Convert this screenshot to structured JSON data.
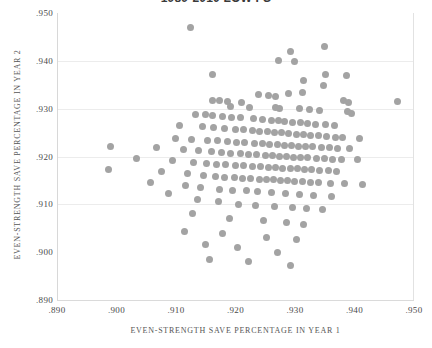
{
  "chart_data": {
    "type": "scatter",
    "title": "1989-2010 LOW FS",
    "xlabel": "EVEN-STRENGTH SAVE PERCENTAGE IN YEAR 1",
    "ylabel": "EVEN-STRENGTH SAVE PERCENTAGE IN YEAR 2",
    "xlim": [
      0.89,
      0.95
    ],
    "ylim": [
      0.89,
      0.95
    ],
    "xticks": [
      0.89,
      0.9,
      0.91,
      0.92,
      0.93,
      0.94,
      0.95
    ],
    "yticks": [
      0.89,
      0.9,
      0.91,
      0.92,
      0.93,
      0.94,
      0.95
    ],
    "xticklabels": [
      ".890",
      ".900",
      ".910",
      ".920",
      ".930",
      ".940",
      ".950"
    ],
    "yticklabels": [
      ".890",
      ".900",
      ".910",
      ".920",
      ".930",
      ".940",
      ".950"
    ],
    "grid": true,
    "gridlines_y": [
      0.91,
      0.92,
      0.93,
      0.94
    ],
    "legend": null,
    "marker_color": "#a3a3a3",
    "marker_size": 7,
    "points": [
      [
        0.9122,
        0.947
      ],
      [
        0.9291,
        0.9419
      ],
      [
        0.9347,
        0.943
      ],
      [
        0.927,
        0.94
      ],
      [
        0.9298,
        0.9399
      ],
      [
        0.935,
        0.9372
      ],
      [
        0.9384,
        0.937
      ],
      [
        0.916,
        0.9371
      ],
      [
        0.9313,
        0.936
      ],
      [
        0.9346,
        0.9348
      ],
      [
        0.931,
        0.9334
      ],
      [
        0.9287,
        0.9332
      ],
      [
        0.9237,
        0.933
      ],
      [
        0.9253,
        0.9328
      ],
      [
        0.9265,
        0.9325
      ],
      [
        0.916,
        0.9318
      ],
      [
        0.9171,
        0.9318
      ],
      [
        0.9184,
        0.9316
      ],
      [
        0.9208,
        0.9314
      ],
      [
        0.938,
        0.9318
      ],
      [
        0.9388,
        0.9312
      ],
      [
        0.919,
        0.9305
      ],
      [
        0.9222,
        0.9303
      ],
      [
        0.9266,
        0.9302
      ],
      [
        0.9273,
        0.93
      ],
      [
        0.9305,
        0.93
      ],
      [
        0.9322,
        0.9298
      ],
      [
        0.934,
        0.9296
      ],
      [
        0.9386,
        0.9294
      ],
      [
        0.9393,
        0.929
      ],
      [
        0.947,
        0.9315
      ],
      [
        0.9131,
        0.9288
      ],
      [
        0.9148,
        0.9288
      ],
      [
        0.916,
        0.9285
      ],
      [
        0.9176,
        0.9284
      ],
      [
        0.9192,
        0.9282
      ],
      [
        0.9206,
        0.9281
      ],
      [
        0.9228,
        0.928
      ],
      [
        0.9243,
        0.9278
      ],
      [
        0.9259,
        0.9276
      ],
      [
        0.927,
        0.9275
      ],
      [
        0.9281,
        0.9274
      ],
      [
        0.9294,
        0.9272
      ],
      [
        0.9308,
        0.9272
      ],
      [
        0.9319,
        0.927
      ],
      [
        0.9333,
        0.9268
      ],
      [
        0.935,
        0.9266
      ],
      [
        0.9364,
        0.9265
      ],
      [
        0.9104,
        0.9265
      ],
      [
        0.9143,
        0.9262
      ],
      [
        0.9162,
        0.926
      ],
      [
        0.9179,
        0.9258
      ],
      [
        0.9198,
        0.9257
      ],
      [
        0.9212,
        0.9256
      ],
      [
        0.9226,
        0.9254
      ],
      [
        0.9239,
        0.9253
      ],
      [
        0.9252,
        0.9252
      ],
      [
        0.9264,
        0.925
      ],
      [
        0.9276,
        0.925
      ],
      [
        0.9288,
        0.9248
      ],
      [
        0.93,
        0.9247
      ],
      [
        0.9313,
        0.9246
      ],
      [
        0.9325,
        0.9244
      ],
      [
        0.9338,
        0.9243
      ],
      [
        0.9352,
        0.9242
      ],
      [
        0.9366,
        0.924
      ],
      [
        0.9378,
        0.9239
      ],
      [
        0.9406,
        0.9238
      ],
      [
        0.9098,
        0.9238
      ],
      [
        0.9124,
        0.9236
      ],
      [
        0.9152,
        0.9234
      ],
      [
        0.9168,
        0.9233
      ],
      [
        0.9185,
        0.9232
      ],
      [
        0.92,
        0.923
      ],
      [
        0.9214,
        0.9229
      ],
      [
        0.923,
        0.9228
      ],
      [
        0.9244,
        0.9227
      ],
      [
        0.9256,
        0.9226
      ],
      [
        0.9268,
        0.9225
      ],
      [
        0.928,
        0.9224
      ],
      [
        0.9292,
        0.9223
      ],
      [
        0.9304,
        0.9222
      ],
      [
        0.9316,
        0.9221
      ],
      [
        0.9328,
        0.922
      ],
      [
        0.9342,
        0.9219
      ],
      [
        0.9356,
        0.9218
      ],
      [
        0.937,
        0.9217
      ],
      [
        0.939,
        0.9216
      ],
      [
        0.8988,
        0.9222
      ],
      [
        0.9066,
        0.9218
      ],
      [
        0.911,
        0.9214
      ],
      [
        0.9136,
        0.9212
      ],
      [
        0.9158,
        0.921
      ],
      [
        0.9174,
        0.9208
      ],
      [
        0.919,
        0.9207
      ],
      [
        0.9206,
        0.9206
      ],
      [
        0.922,
        0.9205
      ],
      [
        0.9234,
        0.9204
      ],
      [
        0.9248,
        0.9203
      ],
      [
        0.926,
        0.9202
      ],
      [
        0.9272,
        0.9201
      ],
      [
        0.9284,
        0.92
      ],
      [
        0.9296,
        0.9199
      ],
      [
        0.9308,
        0.9198
      ],
      [
        0.932,
        0.9197
      ],
      [
        0.9334,
        0.9196
      ],
      [
        0.9348,
        0.9195
      ],
      [
        0.9362,
        0.9194
      ],
      [
        0.9376,
        0.9193
      ],
      [
        0.9404,
        0.9193
      ],
      [
        0.9032,
        0.9196
      ],
      [
        0.9092,
        0.9192
      ],
      [
        0.9128,
        0.9188
      ],
      [
        0.915,
        0.9186
      ],
      [
        0.9166,
        0.9184
      ],
      [
        0.9182,
        0.9183
      ],
      [
        0.9198,
        0.9182
      ],
      [
        0.9212,
        0.9181
      ],
      [
        0.9226,
        0.918
      ],
      [
        0.924,
        0.9179
      ],
      [
        0.9254,
        0.9178
      ],
      [
        0.9266,
        0.9177
      ],
      [
        0.9278,
        0.9176
      ],
      [
        0.929,
        0.9175
      ],
      [
        0.9302,
        0.9174
      ],
      [
        0.9314,
        0.9173
      ],
      [
        0.9326,
        0.9172
      ],
      [
        0.934,
        0.9171
      ],
      [
        0.9354,
        0.917
      ],
      [
        0.9368,
        0.9169
      ],
      [
        0.8984,
        0.9172
      ],
      [
        0.9074,
        0.9168
      ],
      [
        0.9118,
        0.9164
      ],
      [
        0.9144,
        0.916
      ],
      [
        0.9164,
        0.9158
      ],
      [
        0.918,
        0.9157
      ],
      [
        0.9196,
        0.9156
      ],
      [
        0.921,
        0.9155
      ],
      [
        0.9224,
        0.9154
      ],
      [
        0.9238,
        0.9153
      ],
      [
        0.925,
        0.9152
      ],
      [
        0.9262,
        0.9151
      ],
      [
        0.9274,
        0.915
      ],
      [
        0.9286,
        0.9149
      ],
      [
        0.9298,
        0.9148
      ],
      [
        0.931,
        0.9147
      ],
      [
        0.9324,
        0.9146
      ],
      [
        0.9338,
        0.9145
      ],
      [
        0.9358,
        0.9144
      ],
      [
        0.9382,
        0.9143
      ],
      [
        0.9412,
        0.9142
      ],
      [
        0.9056,
        0.9146
      ],
      [
        0.9114,
        0.914
      ],
      [
        0.914,
        0.9136
      ],
      [
        0.9172,
        0.9132
      ],
      [
        0.9194,
        0.913
      ],
      [
        0.9216,
        0.9128
      ],
      [
        0.9236,
        0.9126
      ],
      [
        0.9258,
        0.9124
      ],
      [
        0.9282,
        0.9122
      ],
      [
        0.9306,
        0.912
      ],
      [
        0.933,
        0.9118
      ],
      [
        0.936,
        0.9116
      ],
      [
        0.9086,
        0.9122
      ],
      [
        0.9134,
        0.911
      ],
      [
        0.917,
        0.9105
      ],
      [
        0.9204,
        0.91
      ],
      [
        0.9232,
        0.9098
      ],
      [
        0.9264,
        0.9096
      ],
      [
        0.9294,
        0.9094
      ],
      [
        0.9318,
        0.9092
      ],
      [
        0.9344,
        0.909
      ],
      [
        0.9126,
        0.908
      ],
      [
        0.9188,
        0.907
      ],
      [
        0.9246,
        0.9066
      ],
      [
        0.9284,
        0.9062
      ],
      [
        0.9312,
        0.9058
      ],
      [
        0.9112,
        0.9044
      ],
      [
        0.9176,
        0.904
      ],
      [
        0.925,
        0.903
      ],
      [
        0.93,
        0.9026
      ],
      [
        0.9148,
        0.9016
      ],
      [
        0.9202,
        0.901
      ],
      [
        0.9268,
        0.9
      ],
      [
        0.9154,
        0.8984
      ],
      [
        0.922,
        0.898
      ],
      [
        0.929,
        0.8972
      ]
    ]
  }
}
